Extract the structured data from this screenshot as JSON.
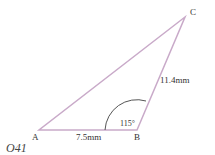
{
  "diagram": {
    "type": "triangle",
    "vertices": [
      {
        "name": "A",
        "x": 39,
        "y": 130
      },
      {
        "name": "B",
        "x": 137,
        "y": 130
      },
      {
        "name": "C",
        "x": 185,
        "y": 17
      }
    ],
    "sides": [
      {
        "from": "A",
        "to": "B",
        "label": "7.5mm"
      },
      {
        "from": "B",
        "to": "C",
        "label": "11.4mm"
      },
      {
        "from": "A",
        "to": "C",
        "label": ""
      }
    ],
    "angle": {
      "vertex": "B",
      "label": "115°"
    },
    "question_id": "O41",
    "colors": {
      "triangle": "#c7a7c7",
      "arc": "#555555",
      "text": "#333333"
    }
  }
}
